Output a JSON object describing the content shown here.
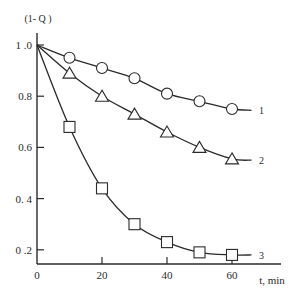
{
  "chart_data": {
    "type": "line",
    "title": "",
    "ylabel": "(1- Q )",
    "xlabel": "t, min",
    "xlim": [
      0,
      70
    ],
    "ylim": [
      0.15,
      1.05
    ],
    "grid": false,
    "legend_position": "inline-right",
    "x_ticks": [
      {
        "value": 0,
        "label": "0"
      },
      {
        "value": 20,
        "label": "20"
      },
      {
        "value": 40,
        "label": "40"
      },
      {
        "value": 60,
        "label": "60"
      }
    ],
    "y_ticks": [
      {
        "value": 1.0,
        "label": "1 .0"
      },
      {
        "value": 0.8,
        "label": "0.8"
      },
      {
        "value": 0.6,
        "label": "0.6"
      },
      {
        "value": 0.4,
        "label": "0. 4"
      },
      {
        "value": 0.2,
        "label": "0 .2"
      }
    ],
    "x": [
      0,
      10,
      20,
      30,
      40,
      50,
      60
    ],
    "series": [
      {
        "name": "1",
        "marker": "circle",
        "values": [
          1.0,
          0.95,
          0.91,
          0.87,
          0.81,
          0.78,
          0.75
        ],
        "curve_end": 0.745
      },
      {
        "name": "2",
        "marker": "triangle",
        "values": [
          1.0,
          0.89,
          0.8,
          0.73,
          0.66,
          0.6,
          0.555
        ],
        "curve_end": 0.55
      },
      {
        "name": "3",
        "marker": "square",
        "values": [
          1.0,
          0.68,
          0.44,
          0.3,
          0.23,
          0.19,
          0.18
        ],
        "curve_end": 0.18
      }
    ]
  },
  "colors": {
    "line": "#2a2a2a",
    "marker_fill": "#ffffff",
    "background": "#ffffff"
  }
}
